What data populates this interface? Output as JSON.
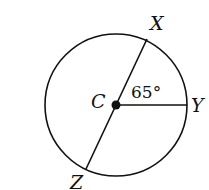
{
  "diagram": {
    "stroke_color": "#111111",
    "background": "#ffffff",
    "circle": {
      "cx": 116,
      "cy": 105,
      "r": 71
    },
    "center": {
      "label": "C",
      "x": 116,
      "y": 105
    },
    "points": [
      {
        "id": "X",
        "label": "X",
        "x": 147,
        "y": 39
      },
      {
        "id": "Y",
        "label": "Y",
        "x": 187,
        "y": 105
      },
      {
        "id": "Z",
        "label": "Z",
        "x": 86,
        "y": 169
      }
    ],
    "segments": [
      {
        "from": "X",
        "to": "Z",
        "type": "diameter"
      },
      {
        "from": "C",
        "to": "Y",
        "type": "radius"
      }
    ],
    "angle": {
      "vertex": "C",
      "between": [
        "X",
        "Y"
      ],
      "label": "65°",
      "value": 65
    }
  }
}
